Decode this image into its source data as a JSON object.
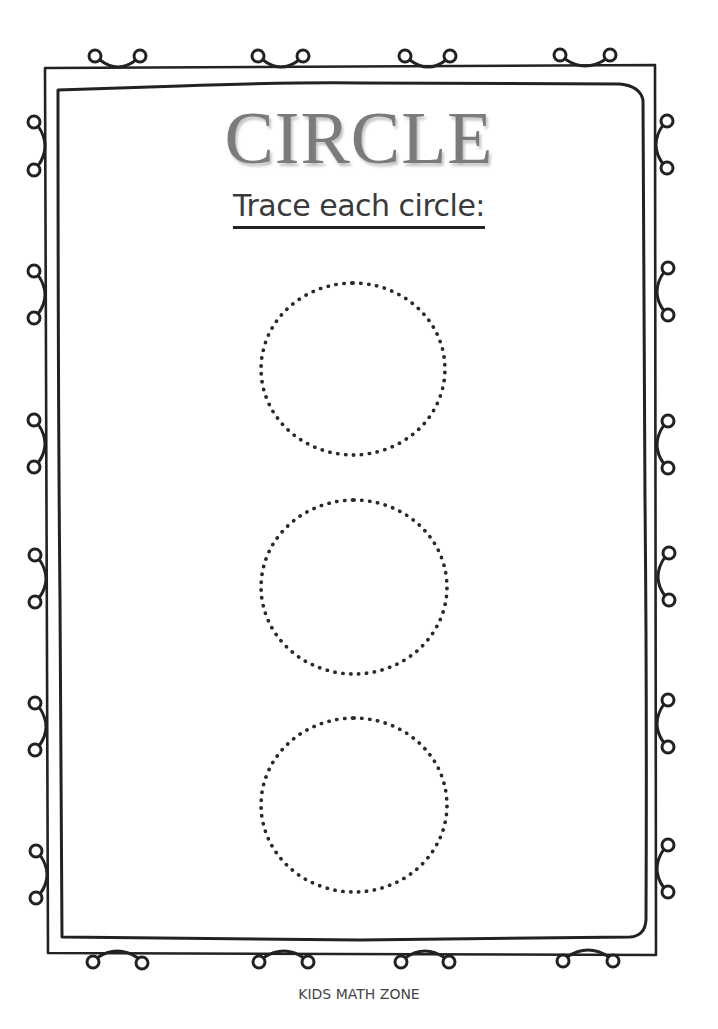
{
  "worksheet": {
    "title": "CIRCLE",
    "instruction": "Trace each circle:",
    "footer": "KIDS MATH ZONE"
  },
  "tracing_shapes": [
    {
      "shape": "circle",
      "style": "dotted",
      "left": 259,
      "top": 281,
      "width": 188,
      "height": 176
    },
    {
      "shape": "circle",
      "style": "dotted",
      "left": 259,
      "top": 498,
      "width": 190,
      "height": 178
    },
    {
      "shape": "circle",
      "style": "dotted",
      "left": 259,
      "top": 716,
      "width": 190,
      "height": 178
    }
  ],
  "colors": {
    "title": "#7b7b7b",
    "text": "#3a3a3a",
    "line": "#222222",
    "background": "#ffffff"
  }
}
